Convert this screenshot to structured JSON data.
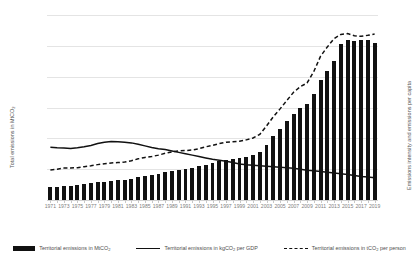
{
  "chart_data": {
    "type": "bar",
    "title": "",
    "xlabel": "",
    "ylabel": "Total emissions in MtCO2",
    "y2label": "Emissions intensity and emissions per capita",
    "grid": true,
    "legend_position": "bottom",
    "ylim": [
      0,
      12000
    ],
    "y2lim": [
      0,
      8
    ],
    "yticks": [
      0,
      2000,
      4000,
      6000,
      8000,
      10000,
      12000
    ],
    "y2ticks": [
      0,
      1,
      2,
      3,
      4,
      5,
      6,
      7,
      8
    ],
    "xtick_labels": [
      "1971",
      "1973",
      "1975",
      "1977",
      "1979",
      "1981",
      "1983",
      "1985",
      "1987",
      "1989",
      "1991",
      "1993",
      "1995",
      "1997",
      "1999",
      "2001",
      "2003",
      "2005",
      "2007",
      "2009",
      "2011",
      "2013",
      "2015",
      "2017",
      "2019"
    ],
    "x": [
      1971,
      1972,
      1973,
      1974,
      1975,
      1976,
      1977,
      1978,
      1979,
      1980,
      1981,
      1982,
      1983,
      1984,
      1985,
      1986,
      1987,
      1988,
      1989,
      1990,
      1991,
      1992,
      1993,
      1994,
      1995,
      1996,
      1997,
      1998,
      1999,
      2000,
      2001,
      2002,
      2003,
      2004,
      2005,
      2006,
      2007,
      2008,
      2009,
      2010,
      2011,
      2012,
      2013,
      2014,
      2015,
      2016,
      2017,
      2018,
      2019
    ],
    "series": [
      {
        "name": "Territorial emissions in MtCO2",
        "type": "bar",
        "axis": "left",
        "unit": "MtCO2",
        "color": "#111111",
        "values": [
          820,
          870,
          930,
          940,
          960,
          1020,
          1080,
          1140,
          1200,
          1240,
          1270,
          1310,
          1380,
          1480,
          1560,
          1620,
          1700,
          1800,
          1880,
          1960,
          2020,
          2080,
          2180,
          2300,
          2400,
          2520,
          2600,
          2650,
          2700,
          2780,
          2900,
          3100,
          3600,
          4150,
          4600,
          5100,
          5600,
          5950,
          6200,
          6900,
          7800,
          8400,
          9000,
          10100,
          10350,
          10300,
          10400,
          10350,
          10200
        ]
      },
      {
        "name": "Territorial emissions in kgCO2 per GDP",
        "type": "line",
        "axis": "right",
        "unit": "kgCO2 per GDP",
        "color": "#111111",
        "style": "solid",
        "values": [
          2.28,
          2.26,
          2.25,
          2.23,
          2.26,
          2.3,
          2.36,
          2.44,
          2.5,
          2.53,
          2.52,
          2.5,
          2.47,
          2.41,
          2.34,
          2.27,
          2.22,
          2.18,
          2.12,
          2.06,
          2.0,
          1.94,
          1.88,
          1.82,
          1.76,
          1.72,
          1.68,
          1.62,
          1.56,
          1.52,
          1.5,
          1.48,
          1.46,
          1.44,
          1.42,
          1.4,
          1.37,
          1.33,
          1.29,
          1.26,
          1.23,
          1.2,
          1.17,
          1.14,
          1.1,
          1.06,
          1.02,
          0.99,
          0.96
        ]
      },
      {
        "name": "Territorial emissions in tCO2 per person",
        "type": "line",
        "axis": "right",
        "unit": "tCO2 per person",
        "color": "#111111",
        "style": "dashed",
        "values": [
          1.3,
          1.33,
          1.38,
          1.38,
          1.4,
          1.44,
          1.48,
          1.53,
          1.57,
          1.6,
          1.62,
          1.64,
          1.7,
          1.78,
          1.84,
          1.88,
          1.94,
          2.02,
          2.08,
          2.12,
          2.14,
          2.16,
          2.22,
          2.3,
          2.36,
          2.44,
          2.5,
          2.52,
          2.54,
          2.6,
          2.68,
          2.84,
          3.2,
          3.6,
          3.94,
          4.3,
          4.66,
          4.9,
          5.06,
          5.56,
          6.22,
          6.62,
          6.98,
          7.16,
          7.2,
          7.1,
          7.08,
          7.12,
          7.18
        ]
      }
    ]
  },
  "legend": {
    "items": [
      {
        "label_main": "Territorial emissions in MtCO",
        "sub": "2",
        "label_tail": "",
        "marker": "bar"
      },
      {
        "label_main": "Territorial emissions in kgCO",
        "sub": "2",
        "label_tail": " per GDP",
        "marker": "line"
      },
      {
        "label_main": "Territorial emissions in tCO",
        "sub": "2",
        "label_tail": " per person",
        "marker": "dashed"
      }
    ]
  },
  "axes": {
    "left_title_main": "Total emissions in MtCO",
    "left_title_sub": "2",
    "right_title": "Emissions intensity and emissions per capita"
  }
}
